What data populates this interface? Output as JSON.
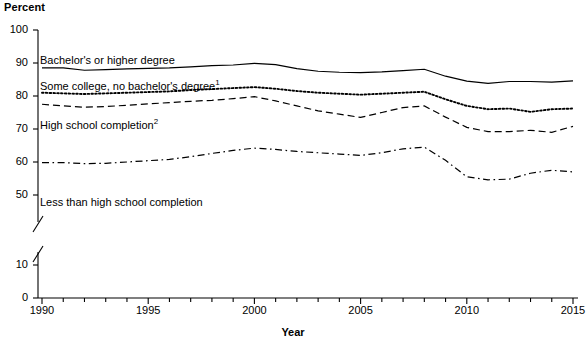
{
  "chart_data": {
    "type": "line",
    "title": "",
    "ylabel": "Percent",
    "xlabel": "Year",
    "ylim": [
      0,
      100
    ],
    "xlim": [
      1990,
      2015
    ],
    "grid": false,
    "legend_position": "inline-labels",
    "y_axis_break": {
      "from": 10,
      "to": 50,
      "present": true
    },
    "y_ticks": [
      0,
      10,
      50,
      60,
      70,
      80,
      90,
      100
    ],
    "y_tick_labels": [
      "0",
      "10",
      "50",
      "60",
      "70",
      "80",
      "90",
      "100"
    ],
    "x_ticks": [
      1990,
      1995,
      2000,
      2005,
      2010,
      2015
    ],
    "x_tick_labels": [
      "1990",
      "1995",
      "2000",
      "2005",
      "2010",
      "2015"
    ],
    "x_minor_tick_every": 1,
    "x": [
      1990,
      1991,
      1992,
      1993,
      1994,
      1995,
      1996,
      1997,
      1998,
      1999,
      2000,
      2001,
      2002,
      2003,
      2004,
      2005,
      2006,
      2007,
      2008,
      2009,
      2010,
      2011,
      2012,
      2013,
      2014,
      2015
    ],
    "series": [
      {
        "name": "Bachelor's or higher degree",
        "style": "solid",
        "color": "#000000",
        "values": [
          88.5,
          88.5,
          87.8,
          88.0,
          88.2,
          88.4,
          88.5,
          88.8,
          89.2,
          89.4,
          89.9,
          89.5,
          88.3,
          87.5,
          87.2,
          87.1,
          87.3,
          87.7,
          88.1,
          86.0,
          84.5,
          83.8,
          84.4,
          84.4,
          84.2,
          84.6
        ]
      },
      {
        "name": "Some college, no bachelor's degree",
        "footnote": "1",
        "style": "dotted",
        "color": "#000000",
        "values": [
          81.0,
          80.8,
          80.6,
          80.8,
          81.0,
          81.2,
          81.4,
          81.8,
          82.1,
          82.4,
          82.7,
          82.2,
          81.5,
          81.0,
          80.7,
          80.4,
          80.7,
          81.0,
          81.3,
          79.0,
          77.0,
          76.0,
          76.2,
          75.2,
          76.0,
          76.2
        ]
      },
      {
        "name": "High school completion",
        "footnote": "2",
        "style": "dashed",
        "color": "#000000",
        "values": [
          77.5,
          77.0,
          76.6,
          76.8,
          77.2,
          77.6,
          78.0,
          78.4,
          78.7,
          79.2,
          79.8,
          78.5,
          77.0,
          75.5,
          74.5,
          73.5,
          75.0,
          76.5,
          77.0,
          73.6,
          70.5,
          69.2,
          69.2,
          69.6,
          69.0,
          70.8
        ]
      },
      {
        "name": "Less than high school completion",
        "style": "dashdot",
        "color": "#000000",
        "values": [
          59.8,
          59.8,
          59.5,
          59.6,
          60.0,
          60.4,
          60.8,
          61.6,
          62.6,
          63.5,
          64.2,
          63.8,
          63.2,
          62.8,
          62.4,
          62.0,
          62.8,
          64.0,
          64.5,
          60.5,
          55.5,
          54.6,
          54.8,
          56.6,
          57.5,
          57.0
        ]
      }
    ],
    "inline_labels": [
      {
        "text": "Bachelor's or higher degree",
        "footnote": "",
        "x_px": 40,
        "y_px": 54
      },
      {
        "text": "Some college, no bachelor's degree",
        "footnote": "1",
        "x_px": 40,
        "y_px": 80
      },
      {
        "text": "High school completion",
        "footnote": "2",
        "x_px": 40,
        "y_px": 119
      },
      {
        "text": "Less than high school completion",
        "footnote": "",
        "x_px": 40,
        "y_px": 196
      }
    ]
  }
}
